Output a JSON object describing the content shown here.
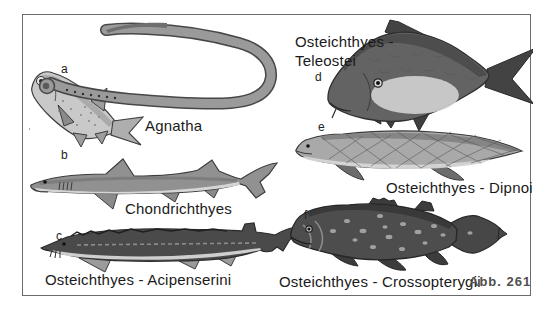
{
  "figure": {
    "background": "#ffffff",
    "border_color": "#6b6b6b",
    "text_color": "#1a1a1a",
    "caption": "Abb. 261",
    "caption_color": "#4f4f4f",
    "panels": [
      {
        "letter": "a",
        "label": "Agnatha",
        "illustration": "lamprey-attached-to-bony-fish"
      },
      {
        "letter": "b",
        "label": "Chondrichthyes",
        "illustration": "shark"
      },
      {
        "letter": "c",
        "label": "Osteichthyes - Acipenserini",
        "illustration": "sturgeon"
      },
      {
        "letter": "d",
        "label_line1": "Osteichthyes -",
        "label_line2": "Teleostei",
        "illustration": "carp"
      },
      {
        "letter": "e",
        "label": "Osteichthyes - Dipnoi",
        "illustration": "lungfish"
      },
      {
        "letter": "f",
        "label": "Osteichthyes - Crossopterygii",
        "illustration": "coelacanth"
      }
    ]
  }
}
